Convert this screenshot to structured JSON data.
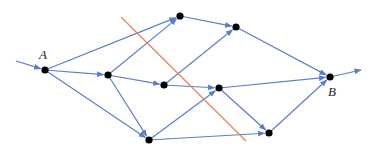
{
  "diagram": {
    "type": "directed-flow-network",
    "colors": {
      "edge": "#5b7fc4",
      "node": "#000000",
      "cut_line": "#e8855a",
      "label": "#222222"
    },
    "labels": {
      "source": "A",
      "sink": "B"
    },
    "nodes": [
      {
        "id": "A",
        "label": "A"
      },
      {
        "id": "n1",
        "label": ""
      },
      {
        "id": "n2",
        "label": ""
      },
      {
        "id": "n3",
        "label": ""
      },
      {
        "id": "n4",
        "label": ""
      },
      {
        "id": "n5",
        "label": ""
      },
      {
        "id": "n6",
        "label": ""
      },
      {
        "id": "n7",
        "label": ""
      },
      {
        "id": "B",
        "label": "B"
      }
    ],
    "edges": [
      {
        "from": "in",
        "to": "A"
      },
      {
        "from": "A",
        "to": "n1"
      },
      {
        "from": "A",
        "to": "n2"
      },
      {
        "from": "A",
        "to": "n5"
      },
      {
        "from": "n2",
        "to": "n1"
      },
      {
        "from": "n2",
        "to": "n3"
      },
      {
        "from": "n2",
        "to": "n5"
      },
      {
        "from": "n3",
        "to": "n4"
      },
      {
        "from": "n3",
        "to": "n6"
      },
      {
        "from": "n1",
        "to": "n4"
      },
      {
        "from": "n5",
        "to": "n6"
      },
      {
        "from": "n5",
        "to": "n7"
      },
      {
        "from": "n4",
        "to": "B"
      },
      {
        "from": "n6",
        "to": "B"
      },
      {
        "from": "n6",
        "to": "n7"
      },
      {
        "from": "n7",
        "to": "B"
      },
      {
        "from": "B",
        "to": "out"
      }
    ],
    "cut": {
      "description": "cut line separating source side from sink side"
    }
  }
}
